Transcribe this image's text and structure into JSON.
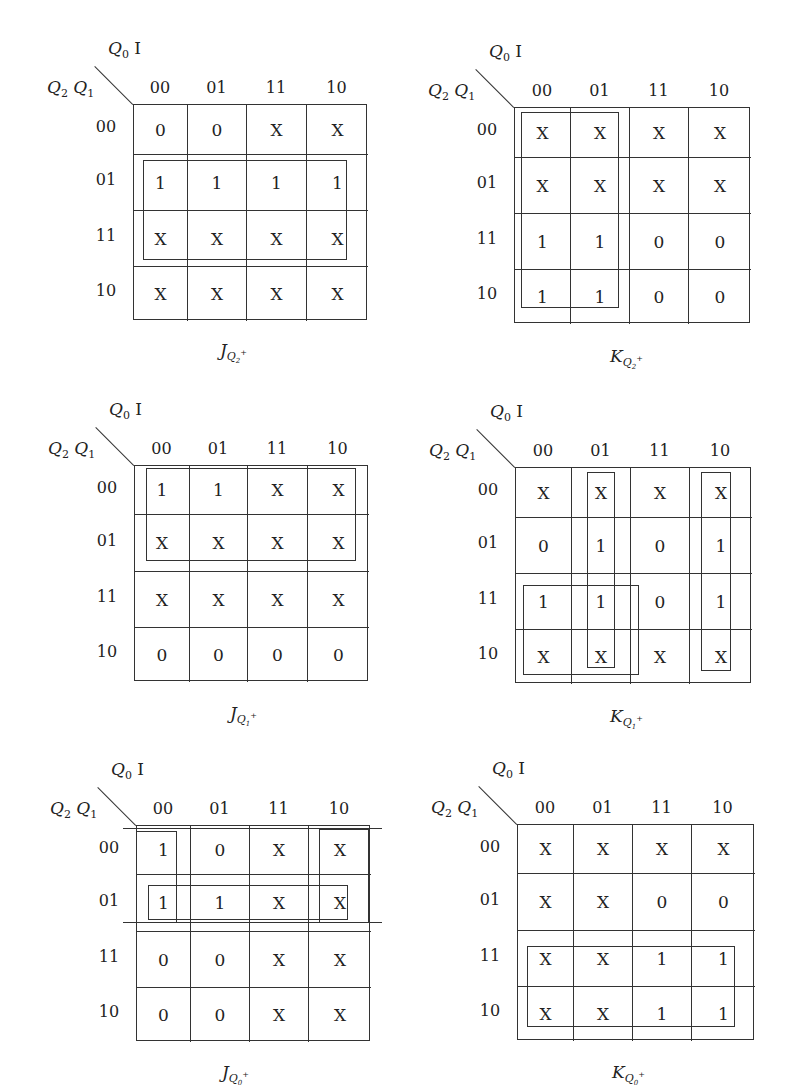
{
  "axis_labels": {
    "top": "Q0 I",
    "left": "Q2 Q1",
    "columns": [
      "00",
      "01",
      "11",
      "10"
    ],
    "rows": [
      "00",
      "01",
      "11",
      "10"
    ]
  },
  "maps": [
    {
      "name": "J_Q2+",
      "title_main": "J",
      "title_sub": "Q",
      "title_subsub": "2",
      "title_sup": "+",
      "cells": [
        [
          "0",
          "0",
          "X",
          "X"
        ],
        [
          "1",
          "1",
          "1",
          "1"
        ],
        [
          "X",
          "X",
          "X",
          "X"
        ],
        [
          "X",
          "X",
          "X",
          "X"
        ]
      ],
      "groups": [
        "rows 01-11, all columns"
      ]
    },
    {
      "name": "K_Q2+",
      "title_main": "K",
      "title_sub": "Q",
      "title_subsub": "2",
      "title_sup": "+",
      "cells": [
        [
          "X",
          "X",
          "X",
          "X"
        ],
        [
          "X",
          "X",
          "X",
          "X"
        ],
        [
          "1",
          "1",
          "0",
          "0"
        ],
        [
          "1",
          "1",
          "0",
          "0"
        ]
      ],
      "groups": [
        "columns 00-01, all rows"
      ]
    },
    {
      "name": "J_Q1+",
      "title_main": "J",
      "title_sub": "Q",
      "title_subsub": "1",
      "title_sup": "+",
      "cells": [
        [
          "1",
          "1",
          "X",
          "X"
        ],
        [
          "X",
          "X",
          "X",
          "X"
        ],
        [
          "X",
          "X",
          "X",
          "X"
        ],
        [
          "0",
          "0",
          "0",
          "0"
        ]
      ],
      "groups": [
        "rows 00-01, all columns"
      ]
    },
    {
      "name": "K_Q1+",
      "title_main": "K",
      "title_sub": "Q",
      "title_subsub": "1",
      "title_sup": "+",
      "cells": [
        [
          "X",
          "X",
          "X",
          "X"
        ],
        [
          "0",
          "1",
          "0",
          "1"
        ],
        [
          "1",
          "1",
          "0",
          "1"
        ],
        [
          "X",
          "X",
          "X",
          "X"
        ]
      ],
      "groups": [
        "column 01, all rows",
        "column 10, all rows",
        "rows 11-10, columns 00-01"
      ]
    },
    {
      "name": "J_Q0+",
      "title_main": "J",
      "title_sub": "Q",
      "title_subsub": "0",
      "title_sup": "+",
      "cells": [
        [
          "1",
          "0",
          "X",
          "X"
        ],
        [
          "1",
          "1",
          "X",
          "X"
        ],
        [
          "0",
          "0",
          "X",
          "X"
        ],
        [
          "0",
          "0",
          "X",
          "X"
        ]
      ],
      "groups": [
        "columns 00 and 10 (wrap), rows 00-01",
        "row 01, all columns"
      ]
    },
    {
      "name": "K_Q0+",
      "title_main": "K",
      "title_sub": "Q",
      "title_subsub": "0",
      "title_sup": "+",
      "cells": [
        [
          "X",
          "X",
          "X",
          "X"
        ],
        [
          "X",
          "X",
          "0",
          "0"
        ],
        [
          "X",
          "X",
          "1",
          "1"
        ],
        [
          "X",
          "X",
          "1",
          "1"
        ]
      ],
      "groups": [
        "rows 11-10, all columns"
      ]
    }
  ]
}
